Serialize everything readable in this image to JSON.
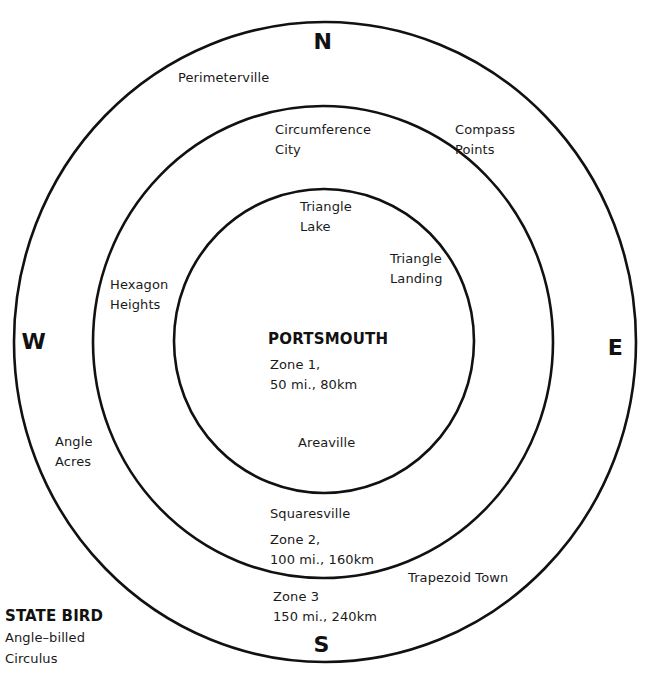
{
  "map": {
    "capital": "PORTSMOUTH",
    "compass": {
      "north": "N",
      "south": "S",
      "east": "E",
      "west": "W"
    },
    "zones": [
      {
        "name": "Zone 1",
        "line1": "Zone 1,",
        "line2": "50 mi., 80km",
        "miles": 50,
        "km": 80
      },
      {
        "name": "Zone 2",
        "line1": "Zone 2,",
        "line2": "100 mi., 160km",
        "miles": 100,
        "km": 160
      },
      {
        "name": "Zone 3",
        "line1": "Zone 3",
        "line2": "150 mi., 240km",
        "miles": 150,
        "km": 240
      }
    ],
    "places": {
      "perimeterville": [
        "Perimeterville"
      ],
      "compass_points": [
        "Compass",
        "Points"
      ],
      "circumference_city": [
        "Circumference",
        "City"
      ],
      "triangle_lake": [
        "Triangle",
        "Lake"
      ],
      "triangle_landing": [
        "Triangle",
        "Landing"
      ],
      "hexagon_heights": [
        "Hexagon",
        "Heights"
      ],
      "areaville": [
        "Areaville"
      ],
      "angle_acres": [
        "Angle",
        "Acres"
      ],
      "squaresville": [
        "Squaresville"
      ],
      "trapezoid_town": [
        "Trapezoid Town"
      ]
    },
    "legend": {
      "title": "STATE BIRD",
      "lines": [
        "Angle–billed",
        "Circulus"
      ]
    },
    "colors": {
      "line": "#111111",
      "background": "#ffffff",
      "text": "#1a1a1a"
    }
  }
}
